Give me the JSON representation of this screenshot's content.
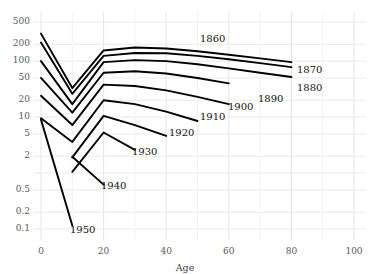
{
  "chart_data": {
    "type": "line",
    "title": "",
    "xlabel": "Age",
    "ylabel": "",
    "xlim": [
      -3,
      105
    ],
    "ylim": [
      0.07,
      700
    ],
    "yscale": "log",
    "grid": true,
    "legend_position": "inline-right-end-labels",
    "xticks": [
      0,
      20,
      40,
      60,
      80,
      100
    ],
    "xtick_labels": [
      "0",
      "20",
      "40",
      "60",
      "80",
      "100"
    ],
    "yticks": [
      500,
      200,
      100,
      50,
      20,
      10,
      5,
      2,
      1,
      0.5,
      0.2,
      0.1
    ],
    "ytick_labels": [
      "500",
      "200",
      "100",
      "50",
      "20",
      "10",
      "5",
      "2",
      "",
      "0.5",
      "0.2",
      "0.1"
    ],
    "x": [
      0,
      10,
      20,
      30,
      40,
      50,
      60,
      70,
      80
    ],
    "series": [
      {
        "name": "1860",
        "label": "1860",
        "values": [
          310,
          33,
          155,
          175,
          168,
          150,
          130,
          112,
          96
        ]
      },
      {
        "name": "1870",
        "label": "1870",
        "values": [
          215,
          26,
          124,
          140,
          138,
          124,
          108,
          92,
          78
        ]
      },
      {
        "name": "1880",
        "label": "1880",
        "values": [
          100,
          17,
          96,
          104,
          100,
          88,
          74,
          62,
          52
        ]
      },
      {
        "name": "1890",
        "label": "1890",
        "values": [
          50,
          12,
          62,
          66,
          60,
          50,
          40,
          null,
          null
        ]
      },
      {
        "name": "1900",
        "label": "1900",
        "values": [
          24,
          7.2,
          38,
          36,
          30,
          23,
          17,
          null,
          null
        ]
      },
      {
        "name": "1910",
        "label": "1910",
        "values": [
          9.5,
          3.6,
          20,
          17,
          12.5,
          8.5,
          null,
          null,
          null
        ]
      },
      {
        "name": "1920",
        "label": "1920",
        "values": [
          null,
          1.9,
          10.5,
          7.2,
          4.6,
          null,
          null,
          null,
          null
        ]
      },
      {
        "name": "1930",
        "label": "1930",
        "values": [
          null,
          1.05,
          5.3,
          2.6,
          null,
          null,
          null,
          null,
          null
        ]
      },
      {
        "name": "1940",
        "label": "1940",
        "values": [
          null,
          1.95,
          0.62,
          null,
          null,
          null,
          null,
          null,
          null
        ]
      },
      {
        "name": "1950",
        "label": "1950",
        "values": [
          9.0,
          0.115,
          null,
          null,
          null,
          null,
          null,
          null,
          null
        ]
      }
    ],
    "label_positions": [
      {
        "text": "1860",
        "x": 45,
        "y": 168,
        "px": 200,
        "py": 40
      },
      {
        "text": "1870",
        "x": 83,
        "y": 96,
        "px": 297,
        "py": 71
      },
      {
        "text": "1880",
        "x": 83,
        "y": 52,
        "px": 297,
        "py": 89
      },
      {
        "text": "1890",
        "x": 62,
        "y": 40,
        "px": 258,
        "py": 100
      },
      {
        "text": "1900",
        "x": 62,
        "y": 17,
        "px": 228,
        "py": 108
      },
      {
        "text": "1910",
        "x": 52,
        "y": 8.5,
        "px": 200,
        "py": 118
      },
      {
        "text": "1920",
        "x": 41,
        "y": 4.6,
        "px": 169,
        "py": 134
      },
      {
        "text": "1930",
        "x": 32,
        "y": 2.6,
        "px": 132,
        "py": 153
      },
      {
        "text": "1940",
        "x": 22,
        "y": 0.62,
        "px": 101,
        "py": 187
      },
      {
        "text": "1950",
        "x": 11,
        "y": 0.115,
        "px": 70,
        "py": 231
      }
    ]
  },
  "axis": {
    "x_title": "Age"
  }
}
